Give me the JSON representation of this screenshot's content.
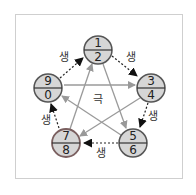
{
  "diagram": {
    "nodes": [
      {
        "id": "n12",
        "top": "1",
        "bottom": "2",
        "cx": 98,
        "cy": 50
      },
      {
        "id": "n34",
        "top": "3",
        "bottom": "4",
        "cx": 151,
        "cy": 88
      },
      {
        "id": "n56",
        "top": "5",
        "bottom": "6",
        "cx": 133,
        "cy": 143
      },
      {
        "id": "n78",
        "top": "7",
        "bottom": "8",
        "cx": 66,
        "cy": 143
      },
      {
        "id": "n90",
        "top": "9",
        "bottom": "0",
        "cx": 48,
        "cy": 88
      }
    ],
    "generating_label": "생",
    "controlling_label": "극",
    "colors": {
      "node_fill": "#d6d6d6",
      "node_stroke": "#555555",
      "node_stroke_highlight": "#9a7c7c",
      "solid_arrow": "#999999",
      "dotted_arrow": "#222222"
    }
  }
}
